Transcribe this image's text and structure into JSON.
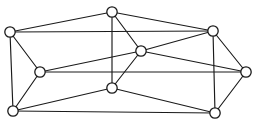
{
  "figure": {
    "type": "node-link-diagram",
    "background_color": "#ffffff",
    "stroke_color": "#1a1a1a",
    "vertex_fill_color": "#ffffff",
    "vertex_count": 9,
    "edge_count": 18,
    "vertex_radius": 5.2,
    "edge_stroke_width": 1.15,
    "vertex_stroke_width": 1.3,
    "width": 255,
    "height": 130
  },
  "graph_data": {
    "type": "graph",
    "directed": false,
    "weighted": false,
    "labels_shown": false,
    "nodes": [
      {
        "id": "v0",
        "name": "top-left",
        "x": 10,
        "y": 32,
        "degree": 4
      },
      {
        "id": "v1",
        "name": "top-center",
        "x": 112,
        "y": 12,
        "degree": 4
      },
      {
        "id": "v2",
        "name": "top-right",
        "x": 213,
        "y": 31,
        "degree": 4
      },
      {
        "id": "v3",
        "name": "left-middle",
        "x": 40,
        "y": 72,
        "degree": 4
      },
      {
        "id": "v4",
        "name": "center",
        "x": 141,
        "y": 51,
        "degree": 5
      },
      {
        "id": "v5",
        "name": "far-right",
        "x": 246,
        "y": 72,
        "degree": 4
      },
      {
        "id": "v6",
        "name": "bottom-left",
        "x": 13,
        "y": 111,
        "degree": 4
      },
      {
        "id": "v7",
        "name": "bottom-center",
        "x": 112,
        "y": 88,
        "degree": 5
      },
      {
        "id": "v8",
        "name": "bottom-right",
        "x": 215,
        "y": 113,
        "degree": 4
      }
    ],
    "edges": [
      {
        "source": "v0",
        "target": "v1",
        "name": "edge-topleft-topcenter"
      },
      {
        "source": "v0",
        "target": "v2",
        "name": "edge-topleft-topright"
      },
      {
        "source": "v0",
        "target": "v3",
        "name": "edge-topleft-leftmiddle"
      },
      {
        "source": "v0",
        "target": "v6",
        "name": "edge-topleft-bottomleft"
      },
      {
        "source": "v1",
        "target": "v2",
        "name": "edge-topcenter-topright"
      },
      {
        "source": "v1",
        "target": "v4",
        "name": "edge-topcenter-center"
      },
      {
        "source": "v1",
        "target": "v7",
        "name": "edge-topcenter-bottomcenter"
      },
      {
        "source": "v2",
        "target": "v5",
        "name": "edge-topright-farright"
      },
      {
        "source": "v2",
        "target": "v4",
        "name": "edge-topright-center"
      },
      {
        "source": "v2",
        "target": "v8",
        "name": "edge-topright-bottomright"
      },
      {
        "source": "v3",
        "target": "v4",
        "name": "edge-leftmiddle-center"
      },
      {
        "source": "v3",
        "target": "v5",
        "name": "edge-leftmiddle-farright"
      },
      {
        "source": "v3",
        "target": "v6",
        "name": "edge-leftmiddle-bottomleft"
      },
      {
        "source": "v4",
        "target": "v5",
        "name": "edge-center-farright"
      },
      {
        "source": "v4",
        "target": "v7",
        "name": "edge-center-bottomcenter"
      },
      {
        "source": "v5",
        "target": "v8",
        "name": "edge-farright-bottomright"
      },
      {
        "source": "v6",
        "target": "v7",
        "name": "edge-bottomleft-bottomcenter"
      },
      {
        "source": "v6",
        "target": "v8",
        "name": "edge-bottomleft-bottomright"
      },
      {
        "source": "v7",
        "target": "v8",
        "name": "edge-bottomcenter-bottomright"
      }
    ]
  }
}
